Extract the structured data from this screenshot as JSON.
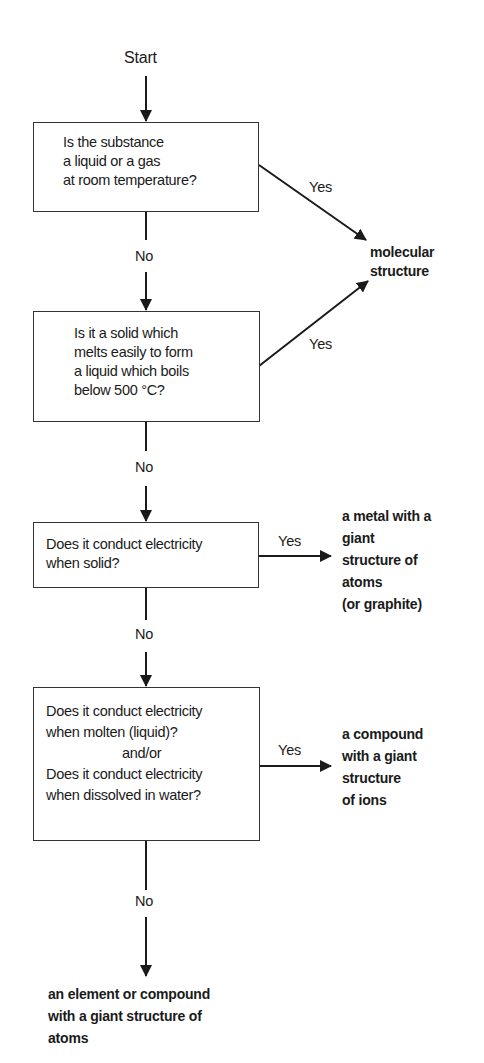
{
  "diagram": {
    "type": "flowchart",
    "start": "Start",
    "decisions": [
      {
        "id": "q1",
        "lines": [
          "Is the substance",
          "a liquid or a gas",
          "at room temperature?"
        ]
      },
      {
        "id": "q2",
        "lines": [
          "Is it a solid which",
          "melts easily to form",
          "a liquid which boils",
          "below 500 °C?"
        ]
      },
      {
        "id": "q3",
        "lines": [
          "Does it conduct electricity",
          "when solid?"
        ]
      },
      {
        "id": "q4",
        "lines": [
          "Does it conduct electricity",
          "when molten (liquid)?",
          "and/or",
          "Does it conduct electricity",
          "when dissolved in water?"
        ]
      }
    ],
    "outcomes": [
      {
        "id": "molecular",
        "lines": [
          "molecular",
          "structure"
        ]
      },
      {
        "id": "metal",
        "lines": [
          "a metal with a",
          "giant",
          "structure of",
          "atoms",
          "(or graphite)"
        ]
      },
      {
        "id": "ionic",
        "lines": [
          "a compound",
          "with a giant",
          "structure",
          "of ions"
        ]
      },
      {
        "id": "covalent-giant",
        "lines": [
          "an element or compound",
          "with a giant structure of",
          "atoms"
        ]
      }
    ],
    "edge_labels": {
      "yes": "Yes",
      "no": "No"
    },
    "edges": [
      {
        "from": "start",
        "to": "q1",
        "label": ""
      },
      {
        "from": "q1",
        "to": "molecular",
        "label": "Yes"
      },
      {
        "from": "q1",
        "to": "q2",
        "label": "No"
      },
      {
        "from": "q2",
        "to": "molecular",
        "label": "Yes"
      },
      {
        "from": "q2",
        "to": "q3",
        "label": "No"
      },
      {
        "from": "q3",
        "to": "metal",
        "label": "Yes"
      },
      {
        "from": "q3",
        "to": "q4",
        "label": "No"
      },
      {
        "from": "q4",
        "to": "ionic",
        "label": "Yes"
      },
      {
        "from": "q4",
        "to": "covalent-giant",
        "label": "No"
      }
    ]
  }
}
